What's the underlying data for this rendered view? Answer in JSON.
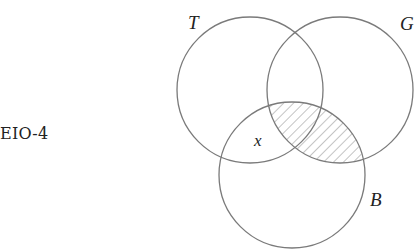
{
  "diagram": {
    "title": "EIO-4",
    "type": "venn",
    "sets": [
      {
        "id": "T",
        "label": "T",
        "cx": 250,
        "cy": 90,
        "r": 73
      },
      {
        "id": "G",
        "label": "G",
        "cx": 340,
        "cy": 90,
        "r": 73
      },
      {
        "id": "B",
        "label": "B",
        "cx": 292,
        "cy": 175,
        "r": 73
      }
    ],
    "shaded_region": "B ∩ G",
    "marker": {
      "label": "x",
      "region": "T ∩ B, outside G"
    },
    "colors": {
      "stroke": "#7a7a7a",
      "text": "#222222",
      "hatch": "#8a8a8a"
    }
  }
}
